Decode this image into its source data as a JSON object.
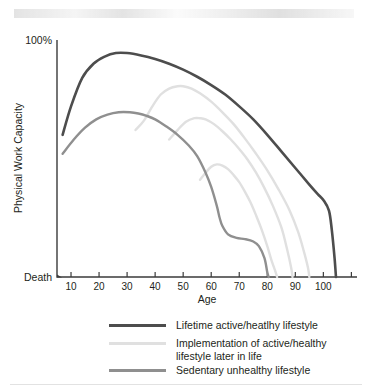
{
  "figure": {
    "scan_artifact": "faded-scanned-text-band",
    "background": "#ffffff"
  },
  "chart_data": {
    "type": "line",
    "title": "",
    "xlabel": "Age",
    "ylabel": "Physical Work Capacity",
    "xlim": [
      5,
      112
    ],
    "ylim": [
      0,
      100
    ],
    "xticks": [
      10,
      20,
      30,
      40,
      50,
      60,
      70,
      80,
      90,
      100
    ],
    "xtick_labels": [
      "10",
      "20",
      "30",
      "40",
      "50",
      "60",
      "70",
      "80",
      "90",
      "100"
    ],
    "ytick_labels": [
      "100%",
      "Death"
    ],
    "ytick_top": "100%",
    "ytick_bottom": "Death",
    "grid": false,
    "legend_position": "below-axes",
    "colors": {
      "lifetime_active": "#4d4d4d",
      "implementation": "#e0e0e0",
      "sedentary": "#8f8f8f"
    },
    "series": [
      {
        "name": "Lifetime active/heatlhy lifestyle",
        "color": "#4d4d4d",
        "width": 2.6,
        "x": [
          7,
          10,
          14,
          18,
          22,
          26,
          30,
          35,
          40,
          45,
          50,
          55,
          60,
          65,
          70,
          75,
          80,
          85,
          90,
          95,
          98,
          100,
          102,
          103,
          104,
          104.5
        ],
        "y": [
          60,
          72,
          84,
          90,
          93,
          94.5,
          94.5,
          93.5,
          92,
          90,
          87.5,
          84.5,
          81,
          77,
          72,
          66.5,
          60,
          53,
          46,
          39,
          35,
          32.5,
          28,
          20,
          8,
          0
        ]
      },
      {
        "name": "Implementation of active/healthy lifestyle later in life (branch at age 35)",
        "color": "#e0e0e0",
        "width": 2.4,
        "x": [
          33,
          36,
          39,
          42,
          45,
          48,
          50,
          53,
          56,
          60,
          64,
          68,
          72,
          76,
          80,
          84,
          88,
          91,
          93,
          94.5,
          95
        ],
        "y": [
          62,
          66,
          72,
          77,
          79.5,
          80.5,
          80.5,
          79.5,
          77.5,
          74,
          69.5,
          64.5,
          58.5,
          52,
          45,
          37,
          28,
          19,
          11,
          4,
          0
        ]
      },
      {
        "name": "Implementation of active/healthy lifestyle later in life (branch at age 47)",
        "color": "#e0e0e0",
        "width": 2.4,
        "x": [
          45,
          48,
          51,
          54,
          56,
          58,
          61,
          64,
          67,
          70,
          73,
          76,
          79,
          82,
          85,
          87,
          88.5,
          89
        ],
        "y": [
          58,
          62,
          65.5,
          67,
          67,
          66.5,
          64.5,
          61.5,
          58,
          54,
          49.5,
          44,
          37.5,
          30,
          21,
          12,
          4,
          0
        ]
      },
      {
        "name": "Implementation of active/healthy lifestyle later in life (branch at age 58)",
        "color": "#e0e0e0",
        "width": 2.4,
        "x": [
          56,
          58,
          60,
          62,
          64,
          66,
          68,
          70,
          72,
          74,
          76,
          78,
          80,
          81.5,
          83,
          83.5
        ],
        "y": [
          41,
          44,
          46.5,
          47.5,
          47,
          45.5,
          43,
          40,
          36,
          31.5,
          26,
          20,
          13,
          7,
          2,
          0
        ]
      },
      {
        "name": "Sedentary unhealthy lifestyle",
        "color": "#8f8f8f",
        "width": 2.4,
        "x": [
          7,
          11,
          15,
          19,
          23,
          27,
          31,
          34,
          37,
          40,
          44,
          48,
          52,
          55,
          58,
          60,
          62,
          63,
          64,
          66,
          69,
          72,
          75,
          77,
          79,
          80,
          80.5
        ],
        "y": [
          52,
          58,
          63,
          66.5,
          68.5,
          69.5,
          69.5,
          69,
          68,
          66.5,
          63.5,
          60,
          55.5,
          51,
          44,
          38,
          30,
          25,
          21.5,
          18,
          16.5,
          16,
          15,
          13,
          8,
          2,
          0
        ]
      }
    ]
  },
  "legend": {
    "items": [
      {
        "label": "Lifetime active/heatlhy lifestyle",
        "color": "#4d4d4d",
        "width": 3.2
      },
      {
        "label": "Implementation of active/healthy",
        "label2": "lifestyle later in life",
        "color": "#e0e0e0",
        "width": 2.8
      },
      {
        "label": "Sedentary unhealthy lifestyle",
        "color": "#8f8f8f",
        "width": 2.8
      }
    ]
  }
}
